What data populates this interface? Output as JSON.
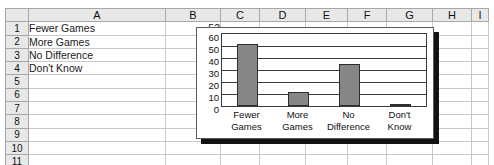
{
  "spreadsheet": {
    "columns": [
      "A",
      "B",
      "C",
      "D",
      "E",
      "F",
      "G",
      "H",
      "I"
    ],
    "rows": [
      "1",
      "2",
      "3",
      "4",
      "5",
      "6",
      "7",
      "8",
      "9",
      "10",
      "11"
    ],
    "cells": [
      {
        "row": "1",
        "a": "Fewer Games",
        "b": "52"
      },
      {
        "row": "2",
        "a": "More Games",
        "b": "12"
      },
      {
        "row": "3",
        "a": "No Difference",
        "b": "35"
      },
      {
        "row": "4",
        "a": "Don't Know",
        "b": "1"
      },
      {
        "row": "5",
        "a": "",
        "b": ""
      },
      {
        "row": "6",
        "a": "",
        "b": ""
      },
      {
        "row": "7",
        "a": "",
        "b": ""
      },
      {
        "row": "8",
        "a": "",
        "b": ""
      },
      {
        "row": "9",
        "a": "",
        "b": ""
      },
      {
        "row": "10",
        "a": "",
        "b": ""
      },
      {
        "row": "11",
        "a": "",
        "b": ""
      }
    ]
  },
  "chart_data": {
    "type": "bar",
    "title": "",
    "xlabel": "",
    "ylabel": "",
    "categories": [
      "Fewer Games",
      "More Games",
      "No Difference",
      "Don't Know"
    ],
    "category_lines": [
      [
        "Fewer",
        "Games"
      ],
      [
        "More",
        "Games"
      ],
      [
        "No",
        "Difference"
      ],
      [
        "Don't",
        "Know"
      ]
    ],
    "values": [
      52,
      12,
      35,
      1
    ],
    "ylim": [
      0,
      60
    ],
    "yticks": [
      60,
      50,
      40,
      30,
      20,
      10,
      0
    ],
    "grid": true,
    "legend": false,
    "bar_color": "#868686",
    "bar_border_color": "#2e2e2e",
    "plot_background": "#ffffff",
    "chart_border_color": "#5a5a5a",
    "shadow_color": "#121212"
  }
}
